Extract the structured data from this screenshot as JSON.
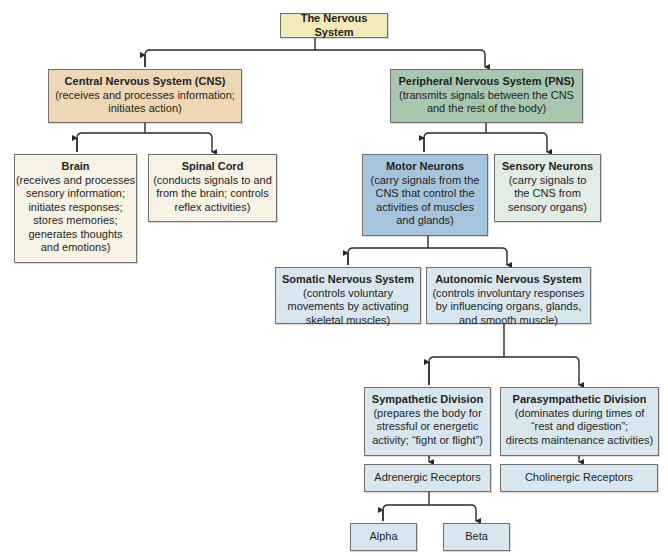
{
  "colors": {
    "root": "#f3e9b6",
    "cns": "#eed7b4",
    "cns_children": "#f8f2e4",
    "pns": "#a9c6ae",
    "sensory": "#e1ece4",
    "motor": "#a7c4dd",
    "light_blue": "#d7e6ef",
    "line": "#2a2a2a"
  },
  "diagram": {
    "root": {
      "title": "The Nervous System"
    },
    "cns": {
      "title": "Central Nervous System (CNS)",
      "desc": "(receives and processes information;\ninitiates action)"
    },
    "pns": {
      "title": "Peripheral Nervous System (PNS)",
      "desc": "(transmits signals between the CNS\nand the rest of the body)"
    },
    "brain": {
      "title": "Brain",
      "desc": "(receives and processes\nsensory information;\ninitiates responses;\nstores memories;\ngenerates thoughts\nand emotions)"
    },
    "spinal_cord": {
      "title": "Spinal Cord",
      "desc": "(conducts signals to and\nfrom the brain; controls\nreflex activities)"
    },
    "motor_neurons": {
      "title": "Motor Neurons",
      "desc": "(carry signals from the\nCNS that control the\nactivities of muscles\nand glands)"
    },
    "sensory_neurons": {
      "title": "Sensory Neurons",
      "desc": "(carry signals to\nthe CNS from\nsensory organs)"
    },
    "somatic": {
      "title": "Somatic Nervous System",
      "desc": "(controls voluntary\nmovements by activating\nskeletal muscles)"
    },
    "autonomic": {
      "title": "Autonomic Nervous System",
      "desc": "(controls involuntary responses\nby influencing organs, glands,\nand smooth muscle)"
    },
    "sympathetic": {
      "title": "Sympathetic Division",
      "desc": "(prepares the body for\nstressful or energetic\nactivity; “fight or flight”)"
    },
    "parasympathetic": {
      "title": "Parasympathetic Division",
      "desc": "(dominates during times of\n“rest and digestion”;\ndirects maintenance activities)"
    },
    "adrenergic": {
      "label": "Adrenergic Receptors"
    },
    "cholinergic": {
      "label": "Cholinergic Receptors"
    },
    "alpha": {
      "label": "Alpha"
    },
    "beta": {
      "label": "Beta"
    }
  }
}
